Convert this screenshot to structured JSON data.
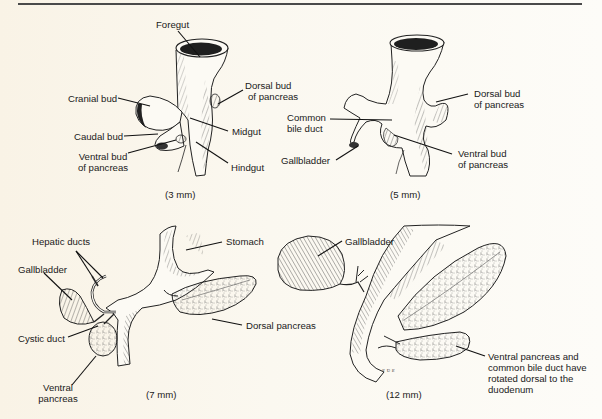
{
  "figure": {
    "panels": [
      {
        "id": "3mm",
        "caption": "(3 mm)",
        "labels": {
          "foregut": "Foregut",
          "cranial_bud": "Cranial bud",
          "dorsal_bud_l1": "Dorsal bud",
          "dorsal_bud_l2": "of pancreas",
          "midgut": "Midgut",
          "caudal_bud": "Caudal bud",
          "ventral_bud_l1": "Ventral bud",
          "ventral_bud_l2": "of pancreas",
          "hindgut": "Hindgut"
        }
      },
      {
        "id": "5mm",
        "caption": "(5 mm)",
        "labels": {
          "dorsal_bud_l1": "Dorsal bud",
          "dorsal_bud_l2": "of pancreas",
          "common_bile_duct_l1": "Common",
          "common_bile_duct_l2": "bile duct",
          "gallbladder": "Gallbladder",
          "ventral_bud_l1": "Ventral bud",
          "ventral_bud_l2": "of pancreas"
        }
      },
      {
        "id": "7mm",
        "caption": "(7 mm)",
        "labels": {
          "hepatic_ducts": "Hepatic ducts",
          "stomach": "Stomach",
          "gallbladder": "Gallbladder",
          "dorsal_pancreas": "Dorsal pancreas",
          "cystic_duct": "Cystic duct",
          "ventral_pancreas_l1": "Ventral",
          "ventral_pancreas_l2": "pancreas"
        }
      },
      {
        "id": "12mm",
        "caption": "(12 mm)",
        "labels": {
          "gallbladder": "Gallbladder",
          "note_l1": "Ventral pancreas and",
          "note_l2": "common bile duct have",
          "note_l3": "rotated dorsal to the",
          "note_l4": "duodenum"
        }
      }
    ]
  },
  "colors": {
    "ink": "#1a1a1a",
    "paper": "#fbf8f0",
    "rule": "#4a4a4a"
  }
}
